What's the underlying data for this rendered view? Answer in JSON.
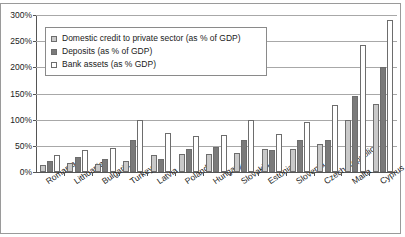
{
  "chart_data": {
    "type": "bar",
    "title": "",
    "xlabel": "",
    "ylabel": "",
    "ylim": [
      0,
      300
    ],
    "ytick_labels": [
      "0%",
      "50%",
      "100%",
      "150%",
      "200%",
      "250%",
      "300%"
    ],
    "ytick_values": [
      0,
      50,
      100,
      150,
      200,
      250,
      300
    ],
    "grid": true,
    "legend_position": "upper-left-inside",
    "categories": [
      "Romania",
      "Lithuania",
      "Bulgaria",
      "Turkey",
      "Latvia",
      "Poland",
      "Hungary",
      "Slovakia",
      "Estonia",
      "Slovenia",
      "Czech Republic",
      "Malta",
      "Cyprus"
    ],
    "series": [
      {
        "name": "Domestic credit to private sector (as % of GDP)",
        "color": "#c9c9c9",
        "values": [
          13,
          18,
          16,
          21,
          32,
          34,
          35,
          37,
          44,
          44,
          53,
          100,
          130
        ]
      },
      {
        "name": "Deposits (as % of GDP)",
        "color": "#7a7a7a",
        "values": [
          22,
          29,
          24,
          62,
          25,
          44,
          48,
          62,
          43,
          62,
          62,
          145,
          200
        ]
      },
      {
        "name": "Bank assets (as % GDP)",
        "color": "#ffffff",
        "values": [
          33,
          43,
          45,
          100,
          75,
          68,
          71,
          100,
          73,
          96,
          128,
          243,
          290
        ]
      }
    ]
  },
  "legend": {
    "items": [
      {
        "label": "Domestic credit to private sector (as % of GDP)",
        "swatch": "credit"
      },
      {
        "label": "Deposits (as % of GDP)",
        "swatch": "deposits"
      },
      {
        "label": "Bank assets (as % GDP)",
        "swatch": "assets"
      }
    ]
  }
}
